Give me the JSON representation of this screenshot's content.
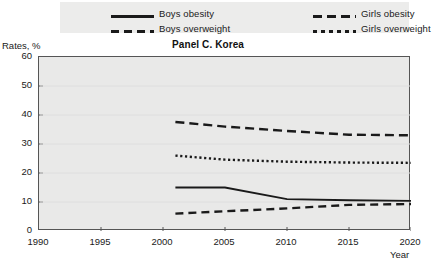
{
  "legend": {
    "items": [
      {
        "label": "Boys obesity",
        "style": "solid",
        "name": "legend-boys-obesity"
      },
      {
        "label": "Girls obesity",
        "style": "longdash",
        "name": "legend-girls-obesity"
      },
      {
        "label": "Boys overweight",
        "style": "meddash",
        "name": "legend-boys-overweight"
      },
      {
        "label": "Girls overweight",
        "style": "dotted",
        "name": "legend-girls-overweight"
      }
    ]
  },
  "axes": {
    "ylabel": "Rates, %",
    "xlabel": "Year",
    "ytick_labels": [
      "60",
      "50",
      "40",
      "30",
      "20",
      "10",
      "0"
    ],
    "xtick_labels": [
      "1990",
      "1995",
      "2000",
      "2005",
      "2010",
      "2015",
      "2020"
    ]
  },
  "colors": {
    "line": "#1a1a1a",
    "plot_background": "#e9e9e8",
    "legend_background": "#ececeb",
    "frame": "#555555"
  },
  "chart_data": {
    "type": "line",
    "title": "Panel C. Korea",
    "xlabel": "Year",
    "ylabel": "Rates, %",
    "xlim": [
      1990,
      2020
    ],
    "ylim": [
      0,
      60
    ],
    "xticks": [
      1990,
      1995,
      2000,
      2005,
      2010,
      2015,
      2020
    ],
    "yticks": [
      0,
      10,
      20,
      30,
      40,
      50,
      60
    ],
    "grid": false,
    "legend_position": "top",
    "series": [
      {
        "name": "Boys obesity",
        "style": "solid",
        "x": [
          2001,
          2005,
          2010,
          2015,
          2020
        ],
        "values": [
          15.0,
          15.0,
          11.0,
          10.6,
          10.4
        ]
      },
      {
        "name": "Girls obesity",
        "style": "longdash",
        "x": [
          2001,
          2005,
          2010,
          2015,
          2020
        ],
        "values": [
          37.6,
          36.0,
          34.5,
          33.2,
          33.0
        ]
      },
      {
        "name": "Boys overweight",
        "style": "meddash",
        "x": [
          2001,
          2005,
          2010,
          2015,
          2020
        ],
        "values": [
          6.0,
          6.8,
          7.8,
          9.0,
          9.3
        ]
      },
      {
        "name": "Girls overweight",
        "style": "dotted",
        "x": [
          2001,
          2005,
          2010,
          2015,
          2020
        ],
        "values": [
          26.0,
          24.6,
          23.9,
          23.6,
          23.5
        ]
      }
    ]
  }
}
